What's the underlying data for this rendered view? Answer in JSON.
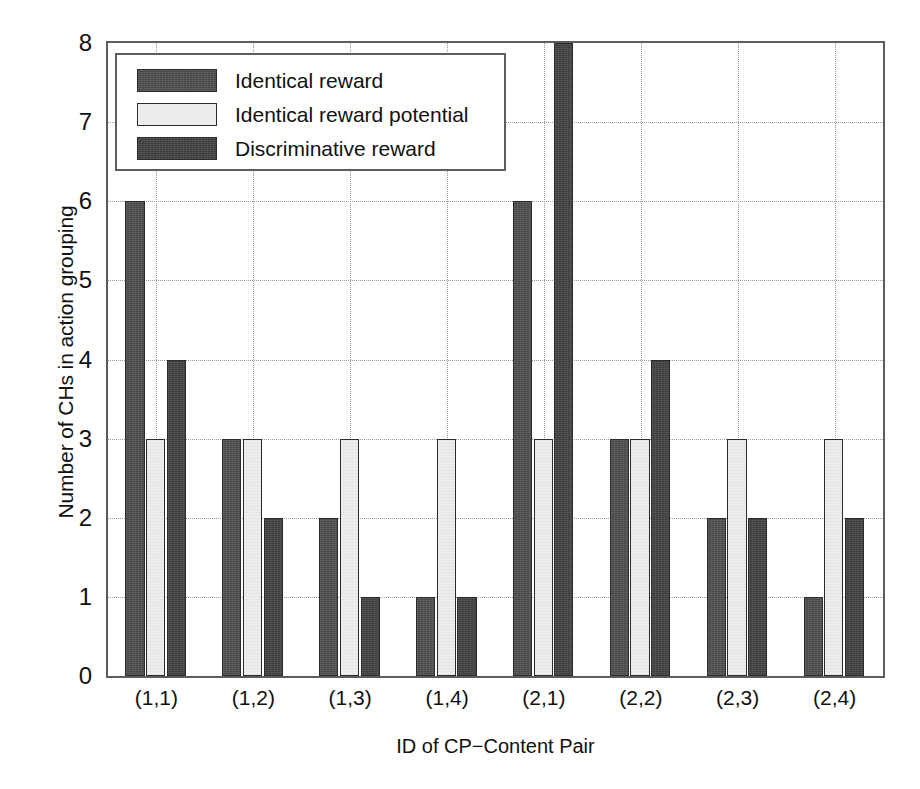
{
  "chart_data": {
    "type": "bar",
    "title": "",
    "xlabel": "ID of CP−Content Pair",
    "ylabel": "Number of CHs in action grouping",
    "categories": [
      "(1,1)",
      "(1,2)",
      "(1,3)",
      "(1,4)",
      "(2,1)",
      "(2,2)",
      "(2,3)",
      "(2,4)"
    ],
    "series": [
      {
        "name": "Identical reward",
        "color": "#4e4e4e",
        "values": [
          6,
          3,
          2,
          1,
          6,
          3,
          2,
          1
        ]
      },
      {
        "name": "Identical reward potential",
        "color": "#ececec",
        "values": [
          3,
          3,
          3,
          3,
          3,
          3,
          3,
          3
        ]
      },
      {
        "name": "Discriminative reward",
        "color": "#414141",
        "values": [
          4,
          2,
          1,
          1,
          8,
          4,
          2,
          2
        ]
      }
    ],
    "ylim": [
      0,
      8
    ],
    "yticks": [
      0,
      1,
      2,
      3,
      4,
      5,
      6,
      7,
      8
    ],
    "ytick_labels": [
      "0",
      "1",
      "2",
      "3",
      "4",
      "5",
      "6",
      "7",
      "8"
    ],
    "grid": "dotted",
    "legend_position": "upper left"
  },
  "legend": {
    "entries": [
      {
        "label": "Identical reward"
      },
      {
        "label": "Identical reward potential"
      },
      {
        "label": "Discriminative reward"
      }
    ]
  }
}
